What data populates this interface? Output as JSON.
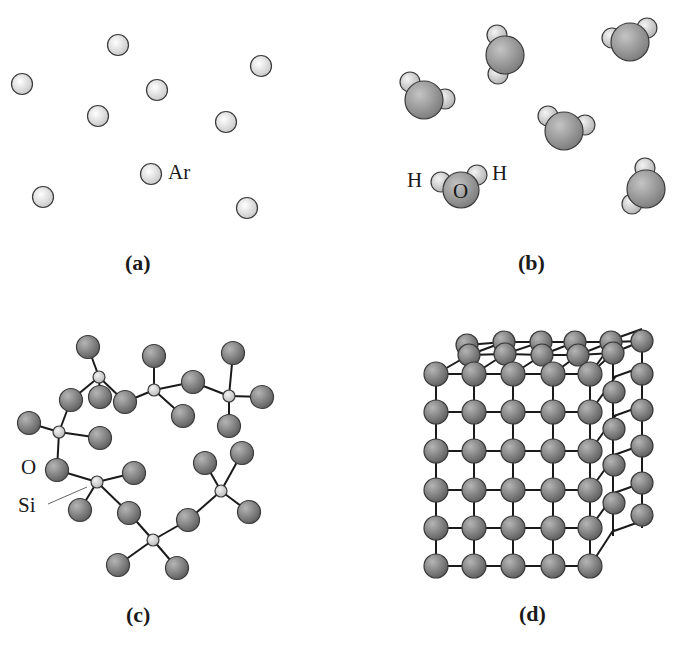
{
  "panels": {
    "a": {
      "caption": "(a)",
      "atom_label": "Ar",
      "atoms": [
        [
          118,
          45
        ],
        [
          22,
          84
        ],
        [
          157,
          90
        ],
        [
          261,
          66
        ],
        [
          98,
          116
        ],
        [
          226,
          122
        ],
        [
          151,
          174
        ],
        [
          43,
          197
        ],
        [
          247,
          208
        ]
      ]
    },
    "b": {
      "caption": "(b)",
      "h_left": "H",
      "o_label": "O",
      "h_right": "H",
      "molecules": [
        {
          "o": [
            505,
            55
          ],
          "h": [
            [
              497,
              35
            ],
            [
              498,
              74
            ]
          ]
        },
        {
          "o": [
            630,
            42
          ],
          "h": [
            [
              612,
              38
            ],
            [
              647,
              28
            ]
          ]
        },
        {
          "o": [
            424,
            100
          ],
          "h": [
            [
              410,
              82
            ],
            [
              445,
              99
            ]
          ]
        },
        {
          "o": [
            564,
            131
          ],
          "h": [
            [
              548,
              116
            ],
            [
              585,
              125
            ]
          ]
        },
        {
          "o": [
            646,
            189
          ],
          "h": [
            [
              645,
              168
            ],
            [
              632,
              204
            ]
          ]
        },
        {
          "o": [
            461,
            190
          ],
          "h": [
            [
              441,
              182
            ],
            [
              477,
              175
            ]
          ]
        }
      ]
    },
    "c": {
      "caption": "(c)",
      "o_label": "O",
      "si_label": "Si"
    },
    "d": {
      "caption": "(d)"
    }
  }
}
